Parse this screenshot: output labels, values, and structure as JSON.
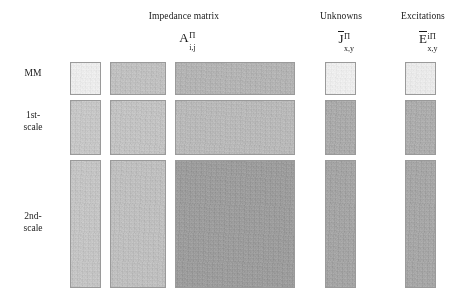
{
  "figure": {
    "title": "",
    "background": "#ffffff",
    "columns": [
      {
        "id": "impedance-matrix",
        "header": "Impedance matrix",
        "symbol": {
          "base": "A",
          "overbar": false,
          "sup": "Π",
          "sub": "i,j"
        },
        "center_x": 184,
        "header_y": 12,
        "symbol_y": 28
      },
      {
        "id": "unknowns",
        "header": "Unknowns",
        "symbol": {
          "base": "J",
          "overbar": true,
          "sup": "Π",
          "sub": "x,y"
        },
        "center_x": 341,
        "header_y": 12,
        "symbol_y": 28
      },
      {
        "id": "excitations",
        "header": "Excitations",
        "symbol": {
          "base": "E",
          "overbar": true,
          "sup": "iΠ",
          "sub": "x,y"
        },
        "center_x": 421,
        "header_y": 12,
        "symbol_y": 28
      }
    ],
    "rows": [
      {
        "id": "mm",
        "label": "MM",
        "label_y": 68
      },
      {
        "id": "1st-scale",
        "label": "1st-\nscale",
        "label_y": 110
      },
      {
        "id": "2nd-scale",
        "label": "2nd-\nscale",
        "label_y": 218
      }
    ],
    "blocks": [
      {
        "id": "mm-a-1",
        "row": "mm",
        "column": "impedance-matrix",
        "x": 70,
        "y": 62,
        "w": 31,
        "h": 33,
        "shade": "#f2f2f2",
        "tone": 0.1
      },
      {
        "id": "mm-a-2",
        "row": "mm",
        "column": "impedance-matrix",
        "x": 110,
        "y": 62,
        "w": 56,
        "h": 33,
        "shade": "#c9c9c9",
        "tone": 0.45
      },
      {
        "id": "mm-a-3",
        "row": "mm",
        "column": "impedance-matrix",
        "x": 175,
        "y": 62,
        "w": 120,
        "h": 33,
        "shade": "#bdbdbd",
        "tone": 0.52
      },
      {
        "id": "mm-j",
        "row": "mm",
        "column": "unknowns",
        "x": 325,
        "y": 62,
        "w": 31,
        "h": 33,
        "shade": "#f3f3f3",
        "tone": 0.09
      },
      {
        "id": "mm-e",
        "row": "mm",
        "column": "excitations",
        "x": 405,
        "y": 62,
        "w": 31,
        "h": 33,
        "shade": "#f0f0f0",
        "tone": 0.11
      },
      {
        "id": "s1-a-1",
        "row": "1st-scale",
        "column": "impedance-matrix",
        "x": 70,
        "y": 100,
        "w": 31,
        "h": 55,
        "shade": "#cfcfcf",
        "tone": 0.4
      },
      {
        "id": "s1-a-2",
        "row": "1st-scale",
        "column": "impedance-matrix",
        "x": 110,
        "y": 100,
        "w": 56,
        "h": 55,
        "shade": "#cbcbcb",
        "tone": 0.43
      },
      {
        "id": "s1-a-3",
        "row": "1st-scale",
        "column": "impedance-matrix",
        "x": 175,
        "y": 100,
        "w": 120,
        "h": 55,
        "shade": "#c2c2c2",
        "tone": 0.48
      },
      {
        "id": "s1-j",
        "row": "1st-scale",
        "column": "unknowns",
        "x": 325,
        "y": 100,
        "w": 31,
        "h": 55,
        "shade": "#b4b4b4",
        "tone": 0.58
      },
      {
        "id": "s1-e",
        "row": "1st-scale",
        "column": "excitations",
        "x": 405,
        "y": 100,
        "w": 31,
        "h": 55,
        "shade": "#b6b6b6",
        "tone": 0.57
      },
      {
        "id": "s2-a-1",
        "row": "2nd-scale",
        "column": "impedance-matrix",
        "x": 70,
        "y": 160,
        "w": 31,
        "h": 128,
        "shade": "#cdcdcd",
        "tone": 0.42
      },
      {
        "id": "s2-a-2",
        "row": "2nd-scale",
        "column": "impedance-matrix",
        "x": 110,
        "y": 160,
        "w": 56,
        "h": 128,
        "shade": "#c8c8c8",
        "tone": 0.45
      },
      {
        "id": "s2-a-3",
        "row": "2nd-scale",
        "column": "impedance-matrix",
        "x": 175,
        "y": 160,
        "w": 120,
        "h": 128,
        "shade": "#a6a6a6",
        "tone": 0.66
      },
      {
        "id": "s2-j",
        "row": "2nd-scale",
        "column": "unknowns",
        "x": 325,
        "y": 160,
        "w": 31,
        "h": 128,
        "shade": "#aeaeae",
        "tone": 0.62
      },
      {
        "id": "s2-e",
        "row": "2nd-scale",
        "column": "excitations",
        "x": 405,
        "y": 160,
        "w": 31,
        "h": 128,
        "shade": "#b0b0b0",
        "tone": 0.61
      }
    ]
  }
}
